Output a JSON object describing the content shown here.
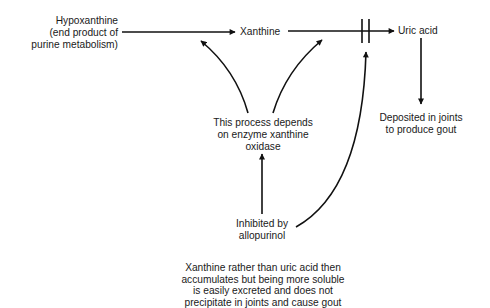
{
  "diagram": {
    "type": "flowchart",
    "nodes": {
      "hypoxanthine": {
        "lines": [
          "Hypoxanthine",
          "(end product of",
          "purine metabolism)"
        ]
      },
      "xanthine": {
        "label": "Xanthine"
      },
      "uric_acid": {
        "label": "Uric acid"
      },
      "deposited": {
        "lines": [
          "Deposited in joints",
          "to produce gout"
        ]
      },
      "enzyme_note": {
        "lines": [
          "This process depends",
          "on enzyme xanthine",
          "oxidase"
        ]
      },
      "inhibitor": {
        "lines": [
          "Inhibited by",
          "allopurinol"
        ]
      },
      "outcome_note": {
        "lines": [
          "Xanthine rather than uric acid then",
          "accumulates but being more soluble",
          "is easily excreted and does not",
          "precipitate in joints and cause gout"
        ]
      }
    },
    "edges": [
      {
        "from": "hypoxanthine",
        "to": "xanthine",
        "style": "arrow"
      },
      {
        "from": "xanthine",
        "to": "uric_acid",
        "style": "arrow-blocked"
      },
      {
        "from": "uric_acid",
        "to": "deposited",
        "style": "arrow"
      },
      {
        "from": "enzyme_note",
        "to": "hypoxanthine-xanthine-step",
        "style": "curved-arrow"
      },
      {
        "from": "enzyme_note",
        "to": "xanthine-uric-acid-step",
        "style": "curved-arrow"
      },
      {
        "from": "inhibitor",
        "to": "enzyme_note",
        "style": "arrow"
      },
      {
        "from": "inhibitor",
        "to": "block-bars",
        "style": "curved-arrow"
      }
    ],
    "colors": {
      "line": "#111111",
      "text": "#1a1a1a",
      "background": "#ffffff"
    }
  }
}
